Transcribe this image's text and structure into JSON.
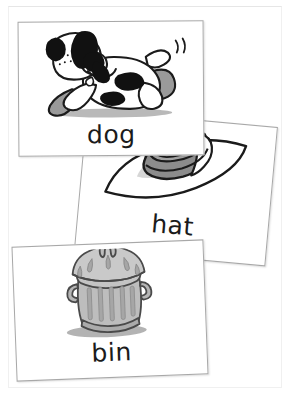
{
  "page": {
    "type": "flashcard-sheet",
    "background_color": "#ffffff",
    "frame_color": "#f0f0f0"
  },
  "cards": [
    {
      "id": "dog",
      "word": "dog",
      "picture": "dog-illustration",
      "picture_description": "cartoon spotted dog leaping, black ears and patches, grey shadow",
      "rotation_deg": -0.4,
      "outline_color": "#a8a8a8",
      "ink_color": "#1b1b1b",
      "fill_color": "#8c8c8c",
      "shadow_color": "#bdbdbd"
    },
    {
      "id": "hat",
      "word": "hat",
      "picture": "hat-illustration",
      "picture_description": "wide brimmed sun hat with grey crown and band",
      "rotation_deg": 5.2,
      "outline_color": "#a8a8a8",
      "ink_color": "#1b1b1b",
      "fill_color": "#8c8c8c",
      "shadow_color": "#c9c9c9"
    },
    {
      "id": "bin",
      "word": "bin",
      "picture": "bin-illustration",
      "picture_description": "grey metal dustbin with domed lid, top handle, side handles and vertical ridges",
      "rotation_deg": -2.2,
      "outline_color": "#a8a8a8",
      "ink_color": "#1b1b1b",
      "fill_color": "#b0b0b0",
      "shadow_color": "#9a9a9a"
    }
  ]
}
